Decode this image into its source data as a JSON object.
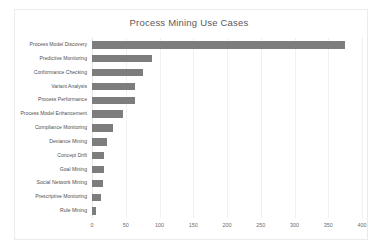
{
  "chart_data": {
    "type": "bar",
    "orientation": "horizontal",
    "title": "Process Mining Use Cases",
    "xlabel": "",
    "ylabel": "",
    "xlim": [
      0,
      400
    ],
    "xticks": [
      0,
      50,
      100,
      150,
      200,
      250,
      300,
      350,
      400
    ],
    "grid": true,
    "legend": "none",
    "bar_color": "#7d7d7d",
    "background_color": "#ffffff",
    "gridline_color": "#f0f0f0",
    "categories": [
      "Process Model Discovery",
      "Predictive Monitoring",
      "Conformance Checking",
      "Variant Analysis",
      "Process Performance",
      "Process Model Enhancement",
      "Compliance Monitoring",
      "Deviance Mining",
      "Concept Drift",
      "Goal Mining",
      "Social Network Mining",
      "Prescriptive Monitoring",
      "Rule Mining"
    ],
    "values": [
      375,
      89,
      76,
      63,
      63,
      46,
      31,
      22,
      18,
      18,
      16,
      13,
      6
    ]
  }
}
